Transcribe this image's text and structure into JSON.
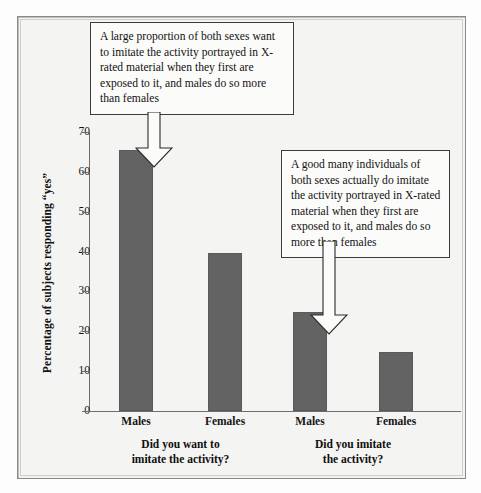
{
  "figure": {
    "background_color": "#f4f4f2",
    "frame_color": "#8a8a8a",
    "bar_color": "#636363"
  },
  "chart_data": {
    "type": "bar",
    "title": "",
    "subtitle": "",
    "xlabel": "",
    "ylabel": "Percentage of subjects responding “yes”",
    "ylim": [
      0,
      70
    ],
    "ytick_step": 10,
    "yticks": [
      70,
      60,
      50,
      40,
      30,
      20,
      10,
      0
    ],
    "ytick_labels": [
      "70",
      "60",
      "50",
      "40",
      "30",
      "20",
      "10",
      "0"
    ],
    "grid": false,
    "legend": null,
    "categories": [
      "Males",
      "Females",
      "Males",
      "Females"
    ],
    "values": [
      65.5,
      39.7,
      24.8,
      14.7
    ],
    "groups": [
      {
        "label_line1": "Did you want to",
        "label_line2": "imitate the activity?",
        "categories": [
          "Males",
          "Females"
        ],
        "values": [
          65.5,
          39.7
        ]
      },
      {
        "label_line1": "Did you imitate",
        "label_line2": "the activity?",
        "categories": [
          "Males",
          "Females"
        ],
        "values": [
          24.8,
          14.7
        ]
      }
    ],
    "annotations": [
      {
        "id": "callout-1",
        "text": "A large proportion of both sexes want to imitate the activity portrayed in X-rated material when they first are exposed to it, and males do so more than females",
        "points_to": "Males bar in group 1"
      },
      {
        "id": "callout-2",
        "text": "A good many individuals of both sexes actually do imitate the activity portrayed in X-rated material when they first are exposed to it, and males do so more than females",
        "points_to": "Males bar in group 2"
      }
    ]
  },
  "ticks": [
    {
      "label": "70",
      "value": 70
    },
    {
      "label": "60",
      "value": 60
    },
    {
      "label": "50",
      "value": 50
    },
    {
      "label": "40",
      "value": 40
    },
    {
      "label": "30",
      "value": 30
    },
    {
      "label": "20",
      "value": 20
    },
    {
      "label": "10",
      "value": 10
    },
    {
      "label": "0",
      "value": 0
    }
  ],
  "bars": [
    {
      "name": "bar-males-want",
      "label": "Males",
      "value": 65.5
    },
    {
      "name": "bar-females-want",
      "label": "Females",
      "value": 39.7
    },
    {
      "name": "bar-males-imitate",
      "label": "Males",
      "value": 24.8
    },
    {
      "name": "bar-females-imitate",
      "label": "Females",
      "value": 14.7
    }
  ],
  "groups": [
    {
      "line1": "Did you want to",
      "line2": "imitate the activity?"
    },
    {
      "line1": "Did you imitate",
      "line2": "the activity?"
    }
  ],
  "callouts": {
    "first": "A large proportion of both sexes want to imitate the activity portrayed in X-rated material when they first are exposed to it, and males do so more than females",
    "second": "A good many individuals of both sexes actually do imitate the activity portrayed in X-rated material when they first are exposed to it, and males do so more than females"
  },
  "axis": {
    "y_title": "Percentage of subjects responding “yes”"
  }
}
